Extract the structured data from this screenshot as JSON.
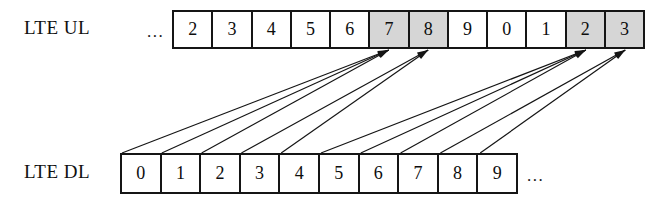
{
  "diagram": {
    "title_text": "",
    "colors": {
      "line": "#151515",
      "shaded_cell": "#d6d6d6",
      "background": "#ffffff",
      "text": "#0d0d0d"
    },
    "rows": [
      {
        "id": "ul",
        "label": "LTE UL",
        "leading_ellipsis": "...",
        "trailing_ellipsis": "",
        "cells": [
          {
            "text": "2",
            "shaded": false
          },
          {
            "text": "3",
            "shaded": false
          },
          {
            "text": "4",
            "shaded": false
          },
          {
            "text": "5",
            "shaded": false
          },
          {
            "text": "6",
            "shaded": false
          },
          {
            "text": "7",
            "shaded": true
          },
          {
            "text": "8",
            "shaded": true
          },
          {
            "text": "9",
            "shaded": false
          },
          {
            "text": "0",
            "shaded": false
          },
          {
            "text": "1",
            "shaded": false
          },
          {
            "text": "2",
            "shaded": true
          },
          {
            "text": "3",
            "shaded": true
          }
        ]
      },
      {
        "id": "dl",
        "label": "LTE DL",
        "leading_ellipsis": "",
        "trailing_ellipsis": "...",
        "cells": [
          {
            "text": "0",
            "shaded": false
          },
          {
            "text": "1",
            "shaded": false
          },
          {
            "text": "2",
            "shaded": false
          },
          {
            "text": "3",
            "shaded": false
          },
          {
            "text": "4",
            "shaded": false
          },
          {
            "text": "5",
            "shaded": false
          },
          {
            "text": "6",
            "shaded": false
          },
          {
            "text": "7",
            "shaded": false
          },
          {
            "text": "8",
            "shaded": false
          },
          {
            "text": "9",
            "shaded": false
          }
        ]
      }
    ],
    "arrows": [
      {
        "from_row": "dl",
        "from_cell": 0,
        "to_row": "ul",
        "to_cell": 5
      },
      {
        "from_row": "dl",
        "from_cell": 1,
        "to_row": "ul",
        "to_cell": 5
      },
      {
        "from_row": "dl",
        "from_cell": 2,
        "to_row": "ul",
        "to_cell": 5
      },
      {
        "from_row": "dl",
        "from_cell": 3,
        "to_row": "ul",
        "to_cell": 6
      },
      {
        "from_row": "dl",
        "from_cell": 4,
        "to_row": "ul",
        "to_cell": 6
      },
      {
        "from_row": "dl",
        "from_cell": 5,
        "to_row": "ul",
        "to_cell": 10
      },
      {
        "from_row": "dl",
        "from_cell": 6,
        "to_row": "ul",
        "to_cell": 10
      },
      {
        "from_row": "dl",
        "from_cell": 7,
        "to_row": "ul",
        "to_cell": 10
      },
      {
        "from_row": "dl",
        "from_cell": 8,
        "to_row": "ul",
        "to_cell": 11
      },
      {
        "from_row": "dl",
        "from_cell": 9,
        "to_row": "ul",
        "to_cell": 11
      }
    ]
  }
}
